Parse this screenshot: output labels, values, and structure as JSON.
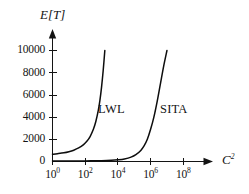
{
  "chart_data": {
    "type": "line",
    "title": "",
    "xlabel": "C^2",
    "xlabel_base": "C",
    "xlabel_exponent": "2",
    "ylabel": "E[T]",
    "x_scale": "log10",
    "y_scale": "linear",
    "xlim": [
      1,
      1000000000
    ],
    "ylim": [
      0,
      11000
    ],
    "grid": false,
    "legend": "inline-labels",
    "xticks": [
      {
        "base": "10",
        "exponent": "0",
        "value": 1
      },
      {
        "base": "10",
        "exponent": "2",
        "value": 100
      },
      {
        "base": "10",
        "exponent": "4",
        "value": 10000
      },
      {
        "base": "10",
        "exponent": "6",
        "value": 1000000
      },
      {
        "base": "10",
        "exponent": "8",
        "value": 100000000
      }
    ],
    "yticks": [
      {
        "label": "0",
        "value": 0
      },
      {
        "label": "2000",
        "value": 2000
      },
      {
        "label": "4000",
        "value": 4000
      },
      {
        "label": "6000",
        "value": 6000
      },
      {
        "label": "8000",
        "value": 8000
      },
      {
        "label": "10000",
        "value": 10000
      }
    ],
    "series": [
      {
        "name": "LWL",
        "color": "#0d0d0d",
        "label_text": "LWL",
        "points_logx_y": [
          [
            0.0,
            650
          ],
          [
            0.3,
            700
          ],
          [
            0.7,
            780
          ],
          [
            1.0,
            880
          ],
          [
            1.3,
            1020
          ],
          [
            1.6,
            1220
          ],
          [
            1.9,
            1520
          ],
          [
            2.1,
            1820
          ],
          [
            2.3,
            2250
          ],
          [
            2.5,
            2900
          ],
          [
            2.65,
            3600
          ],
          [
            2.8,
            4600
          ],
          [
            2.9,
            5500
          ],
          [
            3.0,
            6700
          ],
          [
            3.1,
            8200
          ],
          [
            3.2,
            10000
          ]
        ]
      },
      {
        "name": "SITA",
        "color": "#0d0d0d",
        "label_text": "SITA",
        "points_logx_y": [
          [
            0.0,
            40
          ],
          [
            1.0,
            45
          ],
          [
            2.0,
            55
          ],
          [
            3.0,
            75
          ],
          [
            3.6,
            105
          ],
          [
            4.0,
            150
          ],
          [
            4.4,
            230
          ],
          [
            4.8,
            390
          ],
          [
            5.1,
            620
          ],
          [
            5.4,
            1000
          ],
          [
            5.6,
            1400
          ],
          [
            5.8,
            2000
          ],
          [
            6.0,
            2900
          ],
          [
            6.2,
            4000
          ],
          [
            6.4,
            5400
          ],
          [
            6.6,
            7000
          ],
          [
            6.8,
            8600
          ],
          [
            7.0,
            10000
          ]
        ]
      }
    ]
  },
  "axes": {
    "y_title": "E[T]",
    "x_title_base": "C",
    "x_title_exponent": "2"
  },
  "colors": {
    "background": "#ffffff",
    "ink": "#141414",
    "curve": "#0d0d0d"
  }
}
